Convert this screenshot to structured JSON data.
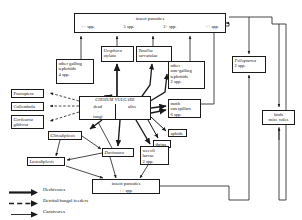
{
  "diagram": {
    "nodes": {
      "top_parasites": {
        "title": "insect parasites",
        "counts": [
          "++ spp.",
          "5 spp.",
          "2+ spp.",
          "++ spp."
        ]
      },
      "other_galling": {
        "l1": "other galling",
        "l2": "tephritids",
        "l3": "4 spp."
      },
      "urophora": {
        "genus": "Urophora",
        "species": "stylata"
      },
      "terellia": {
        "genus": "Terellia",
        "species": "serratulae"
      },
      "other_nongalling": {
        "l1": "other",
        "l2": "non-galling",
        "l3": "tephritids",
        "l4": "2 spp."
      },
      "moth": {
        "l1": "moth",
        "l2": "caterpillars",
        "l3": "6 spp."
      },
      "aphids": {
        "label": "aphids"
      },
      "thrips": {
        "label": "thrips"
      },
      "psocoptera": {
        "label": "Psocoptera"
      },
      "collembola": {
        "label": "Collembola"
      },
      "corticaria": {
        "genus": "Corticaria",
        "species": "gibbosa"
      },
      "plant": {
        "scientific": "CIRSIUM VULGARE",
        "dead": "dead",
        "fungi": "fungi",
        "alive": "alive",
        "plus": "+"
      },
      "clinodiplosis": {
        "label": "Clinodiplosis"
      },
      "dasineura": {
        "label": "Dasineura"
      },
      "lestodiplosis": {
        "label": "Lestodiplosis"
      },
      "weevil": {
        "l1": "weevil",
        "l2": "larvae",
        "l3": "2 spp."
      },
      "bottom_parasites": {
        "title": "insect parasites",
        "count": "++ spp."
      },
      "psilopterna": {
        "genus": "Psilopterna",
        "species": "2 spp."
      },
      "birds": {
        "l1": "birds",
        "l2": "mice  voles"
      }
    },
    "legend": [
      {
        "key": "herbivores",
        "label": "Herbivores",
        "style": "thick-solid"
      },
      {
        "key": "detrital",
        "label": "Detrital/fungal feeders",
        "style": "dashed"
      },
      {
        "key": "carnivores",
        "label": "Carnivores",
        "style": "thin-solid"
      }
    ],
    "colors": {
      "line": "#1a1a1a",
      "text": "#111111",
      "background": "#ffffff"
    }
  }
}
